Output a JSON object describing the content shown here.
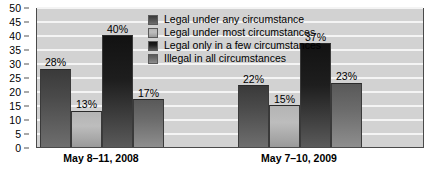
{
  "chart_data": {
    "type": "bar",
    "title": "",
    "subtitle": "",
    "xlabel": "",
    "ylabel": "",
    "ylim": [
      0,
      50
    ],
    "yticks": [
      0,
      5,
      10,
      15,
      20,
      25,
      30,
      35,
      40,
      45,
      50
    ],
    "grid": true,
    "legend_position": "inside-top-center",
    "value_suffix": "%",
    "categories": [
      "May 8–11, 2008",
      "May 7–10, 2009"
    ],
    "series": [
      {
        "name": "Legal under any circumstance",
        "color": "#4a4a4a",
        "values": [
          28,
          22
        ],
        "labels": [
          "28%",
          "22%"
        ]
      },
      {
        "name": "Legal under most circumstances",
        "color": "#bdbdbd",
        "values": [
          13,
          15
        ],
        "labels": [
          "13%",
          "15%"
        ]
      },
      {
        "name": "Legal only in a few circumstances",
        "color": "#1e1e1e",
        "values": [
          40,
          37
        ],
        "labels": [
          "40%",
          "37%"
        ]
      },
      {
        "name": "Illegal in all circumstances",
        "color": "#6b6b6b",
        "values": [
          17,
          23
        ],
        "labels": [
          "17%",
          "23%"
        ]
      }
    ]
  },
  "axis": {
    "y_tick_labels": [
      "50",
      "45",
      "40",
      "35",
      "30",
      "25",
      "20",
      "15",
      "10",
      "5",
      "0"
    ]
  },
  "legend": {
    "items": [
      {
        "label": "Legal under any circumstance"
      },
      {
        "label": "Legal under most circumstances"
      },
      {
        "label": "Legal only in a few circumstances"
      },
      {
        "label": "Illegal in all circumstances"
      }
    ]
  },
  "colors": {
    "plot_background": "#d2d2d2",
    "gridline": "#f4f4f4",
    "axis_line": "#4a4a4a",
    "text": "#000000"
  }
}
